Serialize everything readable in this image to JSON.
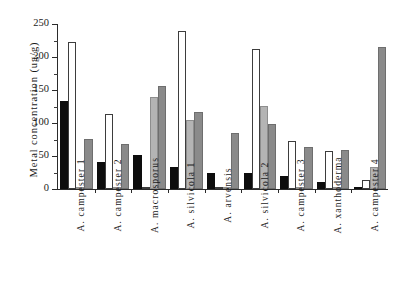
{
  "chart_data": {
    "type": "bar",
    "title": "",
    "xlabel": "",
    "ylabel": "Metal concentration (ug/g)",
    "ylim": [
      0,
      250
    ],
    "yticks": [
      0,
      50,
      100,
      150,
      200,
      250
    ],
    "ytick_labels": [
      "0",
      "50",
      "100",
      "150",
      "200",
      "250"
    ],
    "minor_tick_step": 25,
    "grid": false,
    "legend_position": "none",
    "categories": [
      "A. campester 1",
      "A. campester 2",
      "A. macrosporus",
      "A. silvicola 1",
      "A. arvensis",
      "A. silvicola 2",
      "A. campester 3",
      "A. xanthoderma",
      "A. campester 4"
    ],
    "series": [
      {
        "name": "series-1-black",
        "color": "#0d0d0d",
        "values": [
          133,
          41,
          52,
          33,
          25,
          25,
          19,
          10,
          1
        ]
      },
      {
        "name": "series-2-white",
        "color": "#ffffff",
        "values": [
          222,
          114,
          2,
          240,
          1,
          212,
          73,
          57,
          13
        ]
      },
      {
        "name": "series-3-light-gray",
        "color": "#b4b4b4",
        "values": [
          2,
          2,
          140,
          105,
          1,
          126,
          2,
          2,
          34
        ]
      },
      {
        "name": "series-4-dark-gray",
        "color": "#8a8a8a",
        "values": [
          76,
          68,
          156,
          117,
          85,
          98,
          63,
          59,
          215
        ]
      }
    ]
  }
}
